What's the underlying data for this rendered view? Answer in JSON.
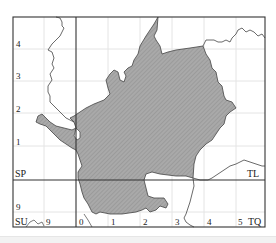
{
  "map": {
    "colors": {
      "frame": "#333333",
      "grid_line": "#e3e3e3",
      "boundary": "#444444",
      "fill": "#a8a8a8",
      "hatch": "#8f8f8f"
    },
    "grid_squares": {
      "top_left": "SP",
      "top_right": "TL",
      "bottom_left": "SU",
      "bottom_right": "TQ"
    },
    "y_axis_labels": [
      "4",
      "3",
      "2",
      "1",
      "9"
    ],
    "x_axis_labels": [
      "9",
      "0",
      "1",
      "2",
      "3",
      "4",
      "5"
    ]
  }
}
